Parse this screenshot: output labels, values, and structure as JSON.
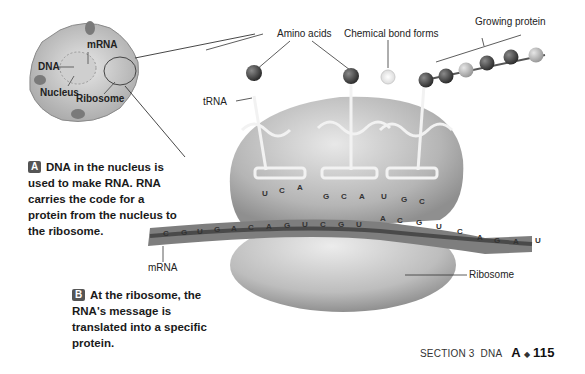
{
  "cell_inset": {
    "labels": {
      "mrna": "mRNA",
      "dna": "DNA",
      "nucleus": "Nucleus",
      "ribosome": "Ribosome"
    }
  },
  "labels": {
    "amino_acids": "Amino acids",
    "chemical_bond": "Chemical bond forms",
    "growing_protein": "Growing protein",
    "trna": "tRNA",
    "mrna": "mRNA",
    "ribosome": "Ribosome"
  },
  "callouts": {
    "a": {
      "badge": "A",
      "text": "DNA in the nucleus is used to make RNA. RNA carries the code for a protein from the nucleus to the ribosome."
    },
    "b": {
      "badge": "B",
      "text": "At the ribosome, the RNA's message is translated into a specific protein."
    }
  },
  "mrna_sequence": [
    "C",
    "G",
    "U",
    "G",
    "A",
    "C",
    "A",
    "G",
    "U",
    "C",
    "G",
    "U",
    "A",
    "C",
    "G",
    "U",
    "C",
    "A",
    "G",
    "A",
    "U"
  ],
  "trna_anticodons": [
    [
      "U",
      "C",
      "A"
    ],
    [
      "G",
      "C",
      "A"
    ],
    [
      "U",
      "G",
      "C"
    ]
  ],
  "footer": {
    "section": "SECTION 3",
    "chapter": "DNA",
    "unit": "A",
    "separator": "◆",
    "page": "115"
  }
}
